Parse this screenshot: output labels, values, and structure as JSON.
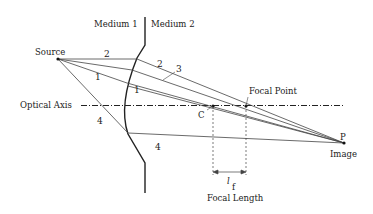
{
  "labels": {
    "medium1": "Medium 1",
    "medium2": "Medium 2",
    "source": "Source",
    "optical_axis": "Optical Axis",
    "focal_point": "Focal Point",
    "center": "C",
    "image_point": "P",
    "image": "Image",
    "focal_length_symbol": "l",
    "focal_length_subscript": "f",
    "focal_length": "Focal Length"
  },
  "ray_numbers": {
    "ray1_in": "1",
    "ray1_out": "1",
    "ray2_in": "2",
    "ray2_out": "2",
    "ray3": "3",
    "ray4_in": "4",
    "ray4_out": "4"
  },
  "colors": {
    "line": "#222222",
    "ray": "#555555"
  }
}
